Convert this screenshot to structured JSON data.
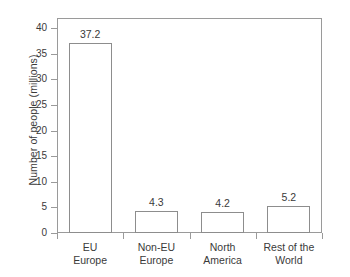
{
  "chart_data": {
    "type": "bar",
    "title": "",
    "subtitle": "",
    "xlabel": "",
    "ylabel": "Number of people (millions)",
    "categories": [
      "EU Europe",
      "Non-EU Europe",
      "North America",
      "Rest of the World"
    ],
    "category_lines": [
      [
        "EU",
        "Europe"
      ],
      [
        "Non-EU",
        "Europe"
      ],
      [
        "North",
        "America"
      ],
      [
        "Rest of the",
        "World"
      ]
    ],
    "values": [
      37.2,
      4.3,
      4.2,
      5.2
    ],
    "value_labels": [
      "37.2",
      "4.3",
      "4.2",
      "5.2"
    ],
    "ylim": [
      0,
      42
    ],
    "ytick_values": [
      0,
      5,
      10,
      15,
      20,
      25,
      30,
      35,
      40
    ],
    "ytick_labels": [
      "0",
      "5",
      "10",
      "15",
      "20",
      "25",
      "30",
      "35",
      "40"
    ],
    "grid": false,
    "legend": false,
    "legend_position": "none",
    "bar_fill_color": "#ffffff",
    "bar_border_color": "#8d8d8d",
    "axis_color": "#9a9a9a",
    "text_color": "#3a3a3a",
    "background_color": "#ffffff"
  }
}
